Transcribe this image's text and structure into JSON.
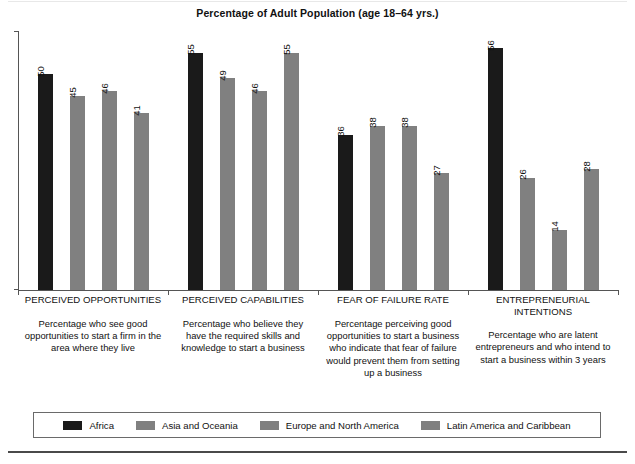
{
  "chart_data": {
    "type": "bar",
    "title": "Percentage of Adult Population (age 18–64 yrs.)",
    "xlabel": "",
    "ylabel": "",
    "ylim": [
      0,
      60
    ],
    "grid": false,
    "legend_position": "bottom",
    "orientation": "vertical",
    "value_label_rotation": "vertical",
    "categories": [
      "PERCEIVED OPPORTUNITIES",
      "PERCEIVED CAPABILITIES",
      "FEAR OF FAILURE RATE",
      "ENTREPRENEURIAL\nINTENTIONS"
    ],
    "category_descriptions": [
      "Percentage who see good opportunities to start a firm in the area where they live",
      "Percentage who believe they have the required skills and knowledge to start a business",
      "Percentage perceiving good opportunities to start a business who indicate that fear of failure would prevent them from setting up a business",
      "Percentage who are latent entrepreneurs and who intend to start a business within 3 years"
    ],
    "series": [
      {
        "name": "Africa",
        "color": "#1a1a1a",
        "values": [
          50,
          55,
          36,
          56
        ]
      },
      {
        "name": "Asia and Oceania",
        "color": "#808080",
        "values": [
          45,
          49,
          38,
          26
        ]
      },
      {
        "name": "Europe and North America",
        "color": "#808080",
        "values": [
          46,
          46,
          38,
          14
        ]
      },
      {
        "name": "Latin America and Caribbean",
        "color": "#808080",
        "values": [
          41,
          55,
          27,
          28
        ]
      }
    ]
  },
  "colors": {
    "africa": "#1a1a1a",
    "other_regions": "#808080",
    "axis": "#555555",
    "text": "#111111",
    "legend_border": "#6a6a6a",
    "bottom_rule": "#4a4a4a"
  }
}
